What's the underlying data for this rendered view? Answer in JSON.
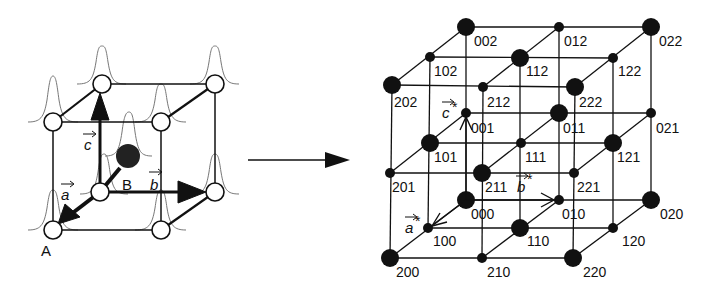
{
  "figure": {
    "real_space": {
      "atom_labels": {
        "A": "A",
        "B": "B"
      },
      "vectors": {
        "a": "a",
        "b": "b",
        "c": "c"
      }
    },
    "transform_arrow": "→",
    "reciprocal_space": {
      "vectors": {
        "a_star": "a",
        "b_star": "b",
        "c_star": "c",
        "star": "*"
      },
      "nodes": [
        {
          "label": "002",
          "x": 466,
          "y": 27,
          "large": true
        },
        {
          "label": "012",
          "x": 559,
          "y": 27,
          "large": false
        },
        {
          "label": "022",
          "x": 651,
          "y": 27,
          "large": true
        },
        {
          "label": "102",
          "x": 430,
          "y": 57,
          "large": false
        },
        {
          "label": "112",
          "x": 520,
          "y": 58,
          "large": true
        },
        {
          "label": "122",
          "x": 613,
          "y": 58,
          "large": false
        },
        {
          "label": "202",
          "x": 392,
          "y": 85,
          "large": true
        },
        {
          "label": "212",
          "x": 483,
          "y": 87,
          "large": false
        },
        {
          "label": "222",
          "x": 575,
          "y": 87,
          "large": true
        },
        {
          "label": "001",
          "x": 466,
          "y": 113,
          "large": false
        },
        {
          "label": "011",
          "x": 559,
          "y": 113,
          "large": true
        },
        {
          "label": "021",
          "x": 651,
          "y": 113,
          "large": false
        },
        {
          "label": "101",
          "x": 430,
          "y": 143,
          "large": true
        },
        {
          "label": "111",
          "x": 521,
          "y": 143,
          "large": false
        },
        {
          "label": "121",
          "x": 613,
          "y": 143,
          "large": true
        },
        {
          "label": "201",
          "x": 390,
          "y": 173,
          "large": false
        },
        {
          "label": "211",
          "x": 482,
          "y": 173,
          "large": true
        },
        {
          "label": "221",
          "x": 574,
          "y": 173,
          "large": false
        },
        {
          "label": "000",
          "x": 466,
          "y": 200,
          "large": true
        },
        {
          "label": "010",
          "x": 559,
          "y": 200,
          "large": false
        },
        {
          "label": "020",
          "x": 651,
          "y": 200,
          "large": true
        },
        {
          "label": "100",
          "x": 428,
          "y": 228,
          "large": false
        },
        {
          "label": "110",
          "x": 520,
          "y": 228,
          "large": true
        },
        {
          "label": "120",
          "x": 613,
          "y": 228,
          "large": false
        },
        {
          "label": "200",
          "x": 390,
          "y": 258,
          "large": true
        },
        {
          "label": "210",
          "x": 482,
          "y": 258,
          "large": false
        },
        {
          "label": "220",
          "x": 573,
          "y": 258,
          "large": true
        }
      ]
    }
  }
}
